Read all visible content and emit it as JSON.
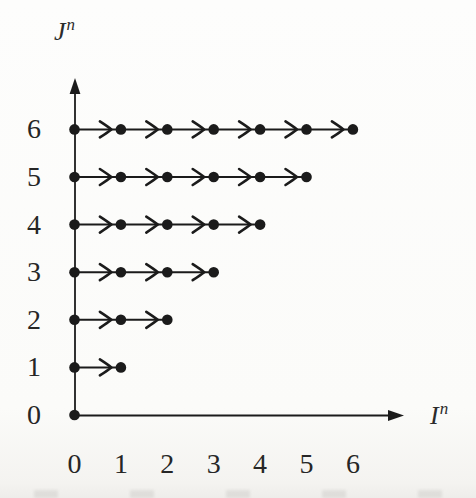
{
  "figure": {
    "y_axis_label": {
      "base": "J",
      "sup": "n"
    },
    "x_axis_label": {
      "base": "I",
      "sup": "n"
    },
    "ink_color": "#1b1b1b",
    "text_color": "#262626",
    "background_color": "#fcfcfa"
  },
  "chart_data": {
    "type": "scatter",
    "xlabel": "Iⁿ",
    "ylabel": "Jⁿ",
    "x_ticks": [
      "0",
      "1",
      "2",
      "3",
      "4",
      "5",
      "6"
    ],
    "y_ticks": [
      "0",
      "1",
      "2",
      "3",
      "4",
      "5",
      "6"
    ],
    "xlim": [
      0,
      6
    ],
    "ylim": [
      0,
      6
    ],
    "grid": false,
    "legend": "none",
    "arrow_direction": "right",
    "rows": [
      {
        "j": 0,
        "points_x": [
          0
        ],
        "arrow_segments": 0
      },
      {
        "j": 1,
        "points_x": [
          0,
          1
        ],
        "arrow_segments": 1
      },
      {
        "j": 2,
        "points_x": [
          0,
          1,
          2
        ],
        "arrow_segments": 2
      },
      {
        "j": 3,
        "points_x": [
          0,
          1,
          2,
          3
        ],
        "arrow_segments": 3
      },
      {
        "j": 4,
        "points_x": [
          0,
          1,
          2,
          3,
          4
        ],
        "arrow_segments": 4
      },
      {
        "j": 5,
        "points_x": [
          0,
          1,
          2,
          3,
          4,
          5
        ],
        "arrow_segments": 5
      },
      {
        "j": 6,
        "points_x": [
          0,
          1,
          2,
          3,
          4,
          5,
          6
        ],
        "arrow_segments": 6
      }
    ]
  }
}
